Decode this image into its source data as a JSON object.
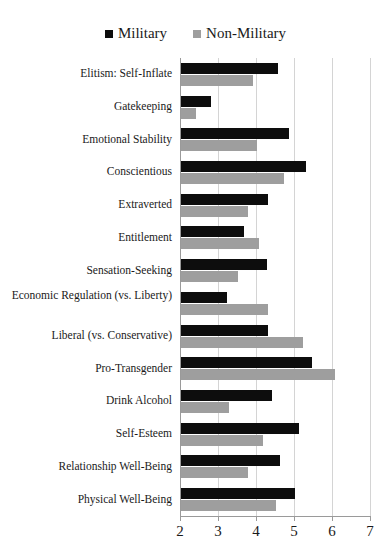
{
  "legend": {
    "entries": [
      {
        "label": "Military",
        "color": "#0d0d0d",
        "marker": "square-marker"
      },
      {
        "label": "Non-Military",
        "color": "#9e9e9e",
        "marker": "square-marker"
      }
    ]
  },
  "chart_data": {
    "type": "bar",
    "orientation": "horizontal",
    "title": "",
    "subtitle": "",
    "xlabel": "",
    "ylabel": "",
    "xlim": [
      2,
      7
    ],
    "xticks": [
      2,
      3,
      4,
      5,
      6,
      7
    ],
    "grid": "vertical",
    "legend_position": "top-center",
    "categories": [
      "Elitism: Self-Inflate",
      "Gatekeeping",
      "Emotional Stability",
      "Conscientious",
      "Extraverted",
      "Entitlement",
      "Sensation-Seeking",
      "Economic Regulation (vs. Liberty)",
      "Liberal (vs. Conservative)",
      "Pro-Transgender",
      "Drink Alcohol",
      "Self-Esteem",
      "Relationship Well-Being",
      "Physical Well-Being"
    ],
    "series": [
      {
        "name": "Military",
        "color": "#0d0d0d",
        "values": [
          4.55,
          2.8,
          4.85,
          5.3,
          4.3,
          3.65,
          4.25,
          3.2,
          4.3,
          5.45,
          4.4,
          5.1,
          4.6,
          5.0
        ]
      },
      {
        "name": "Non-Military",
        "color": "#9e9e9e",
        "values": [
          3.9,
          2.4,
          4.0,
          4.7,
          3.75,
          4.05,
          3.5,
          4.3,
          5.2,
          6.05,
          3.25,
          4.15,
          3.75,
          4.5
        ]
      }
    ]
  },
  "axis": {
    "tick_labels": [
      "2",
      "3",
      "4",
      "5",
      "6",
      "7"
    ],
    "gridline_color": "#d4d4d4",
    "axis_color": "#9a9a9a"
  }
}
